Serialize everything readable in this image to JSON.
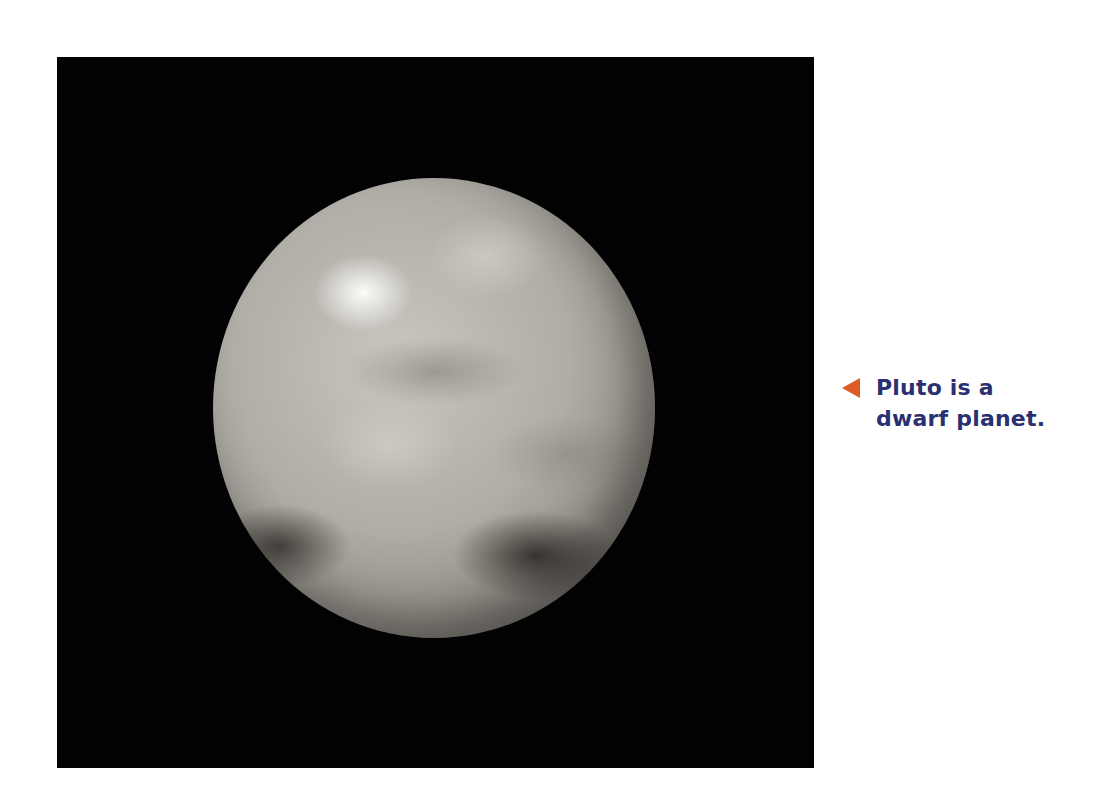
{
  "image": {
    "subject": "Pluto",
    "background_color": "#020203",
    "planet_color": "#b0ada6"
  },
  "caption": {
    "pointer_icon": "left-triangle-pointer",
    "pointer_color": "#E05A28",
    "text_color": "#2B3170",
    "lines": [
      "Pluto is a",
      "dwarf planet."
    ]
  }
}
